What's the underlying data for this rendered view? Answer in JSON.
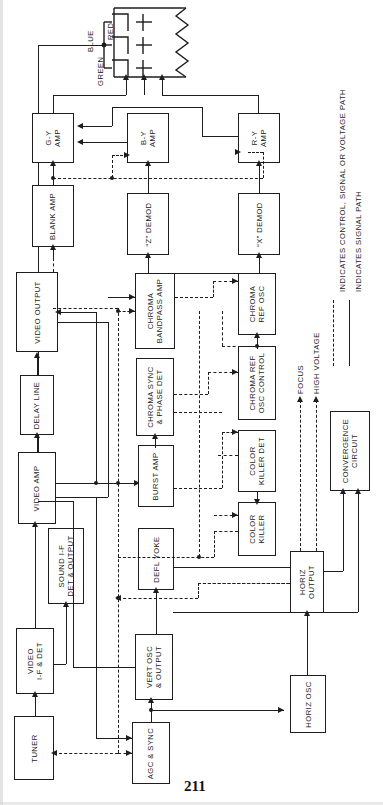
{
  "document": {
    "type": "schematic-block-diagram",
    "subject": "Color television receiver block diagram",
    "orientation": "rotated-90-ccw",
    "page_number": "211"
  },
  "crt": {
    "name": "picture-tube",
    "gun_labels": [
      "BLUE",
      "RED",
      "GREEN"
    ],
    "screen_symbol": "zigzag-phosphor"
  },
  "blocks": [
    {
      "id": "gy_amp",
      "label": "G-Y\nAMP",
      "line1": "G-Y",
      "line2": "AMP"
    },
    {
      "id": "by_amp",
      "label": "B-Y\nAMP",
      "line1": "B-Y",
      "line2": "AMP"
    },
    {
      "id": "ry_amp",
      "label": "R-Y\nAMP",
      "line1": "R-Y",
      "line2": "AMP"
    },
    {
      "id": "blank_amp",
      "label": "BLANK AMP",
      "line1": "BLANK AMP",
      "line2": ""
    },
    {
      "id": "z_demod",
      "label": "“Z” DEMOD",
      "line1": "“Z” DEMOD",
      "line2": ""
    },
    {
      "id": "x_demod",
      "label": "“X” DEMOD",
      "line1": "“X” DEMOD",
      "line2": ""
    },
    {
      "id": "video_output",
      "label": "VIDEO OUTPUT",
      "line1": "VIDEO OUTPUT",
      "line2": ""
    },
    {
      "id": "delay_line",
      "label": "DELAY LINE",
      "line1": "DELAY LINE",
      "line2": ""
    },
    {
      "id": "video_amp",
      "label": "VIDEO AMP",
      "line1": "VIDEO AMP",
      "line2": ""
    },
    {
      "id": "sound_if",
      "label": "SOUND I-F\nDET & OUTPUT",
      "line1": "SOUND I-F",
      "line2": "DET & OUTPUT"
    },
    {
      "id": "video_if_det",
      "label": "VIDEO\nI-F & DET",
      "line1": "VIDEO",
      "line2": "I-F & DET"
    },
    {
      "id": "tuner",
      "label": "TUNER",
      "line1": "TUNER",
      "line2": ""
    },
    {
      "id": "chroma_bp",
      "label": "CHROMA\nBANDPASS AMP",
      "line1": "CHROMA",
      "line2": "BANDPASS AMP"
    },
    {
      "id": "chroma_sync",
      "label": "CHROMA SYNC\n& PHASE DET",
      "line1": "CHROMA SYNC",
      "line2": "& PHASE DET"
    },
    {
      "id": "burst_amp",
      "label": "BURST AMP",
      "line1": "BURST AMP",
      "line2": ""
    },
    {
      "id": "defl_yoke",
      "label": "DEFL YOKE",
      "line1": "DEFL YOKE",
      "line2": ""
    },
    {
      "id": "vert_osc",
      "label": "VERT OSC\n& OUTPUT",
      "line1": "VERT OSC",
      "line2": "& OUTPUT"
    },
    {
      "id": "agc_sync",
      "label": "AGC & SYNC",
      "line1": "AGC & SYNC",
      "line2": ""
    },
    {
      "id": "chroma_ref_osc",
      "label": "CHROMA\nREF OSC",
      "line1": "CHROMA",
      "line2": "REF OSC"
    },
    {
      "id": "chroma_ref_ctl",
      "label": "CHROMA REF\nOSC CONTROL",
      "line1": "CHROMA REF",
      "line2": "OSC CONTROL"
    },
    {
      "id": "color_killer_det",
      "label": "COLOR\nKILLER DET",
      "line1": "COLOR",
      "line2": "KILLER DET"
    },
    {
      "id": "color_killer",
      "label": "COLOR\nKILLER",
      "line1": "COLOR",
      "line2": "KILLER"
    },
    {
      "id": "horiz_output",
      "label": "HORIZ\nOUTPUT",
      "line1": "HORIZ",
      "line2": "OUTPUT"
    },
    {
      "id": "horiz_osc",
      "label": "HORIZ OSC",
      "line1": "HORIZ OSC",
      "line2": ""
    },
    {
      "id": "convergence",
      "label": "CONVERGENCE\nCIRCUIT",
      "line1": "CONVERGENCE",
      "line2": "CIRCUIT"
    }
  ],
  "output_labels": {
    "focus": "FOCUS",
    "high_voltage": "HIGH VOLTAGE"
  },
  "legend": {
    "dashed": "INDICATES CONTROL, SIGNAL OR VOLTAGE PATH",
    "solid": "INDICATES SIGNAL PATH"
  },
  "colors": {
    "ink": "#1d1d1d",
    "paper": "#ffffff",
    "page_edge": "#cfcfcf"
  }
}
